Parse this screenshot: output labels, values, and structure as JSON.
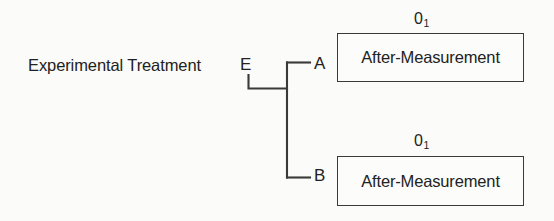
{
  "diagram": {
    "treatment_label": "Experimental Treatment",
    "nodes": {
      "root": "E",
      "branch_a": "A",
      "branch_b": "B"
    },
    "groups": [
      {
        "branch": "A",
        "observation_symbol": "0",
        "observation_subscript": "1",
        "box_text": "After-Measurement"
      },
      {
        "branch": "B",
        "observation_symbol": "0",
        "observation_subscript": "1",
        "box_text": "After-Measurement"
      }
    ],
    "colors": {
      "background": "#fbfbf9",
      "text": "#222222",
      "line": "#3a3a3a",
      "box_border": "#3a3a3a",
      "box_fill": "#fcfcfa"
    }
  }
}
